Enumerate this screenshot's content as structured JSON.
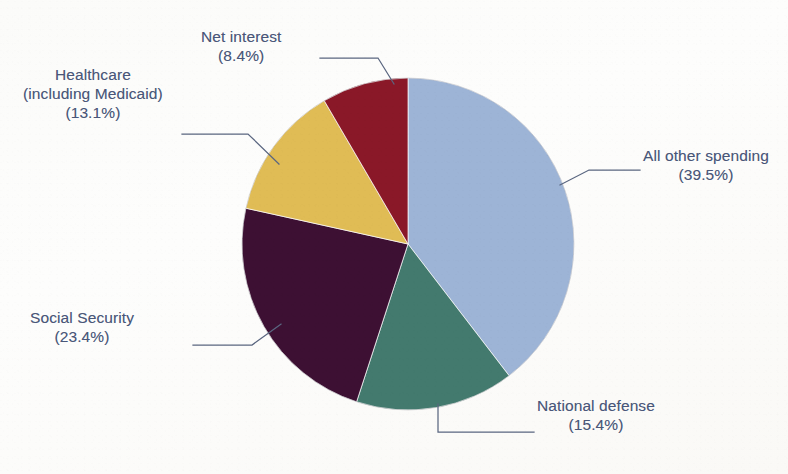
{
  "chart_data": {
    "type": "pie",
    "title": "",
    "subtitle": "",
    "xlabel": "",
    "ylabel": "",
    "legend_position": "none",
    "grid": false,
    "labels_inline": false,
    "start_angle_deg": 0,
    "direction": "clockwise",
    "categories": [
      "All other spending",
      "National defense",
      "Social Security",
      "Healthcare (including Medicaid)",
      "Net interest"
    ],
    "values": [
      39.5,
      15.4,
      23.4,
      13.1,
      8.4
    ],
    "value_unit": "%",
    "colors": [
      "#9db4d6",
      "#437a6e",
      "#3d1033",
      "#e0bc55",
      "#8a1828"
    ],
    "slices": [
      {
        "name": "All other spending",
        "value": 39.5,
        "value_text": "(39.5%)",
        "color": "#9db4d6",
        "start_deg": 0,
        "end_deg": 142.2
      },
      {
        "name": "National defense",
        "value": 15.4,
        "value_text": "(15.4%)",
        "color": "#437a6e",
        "start_deg": 142.2,
        "end_deg": 197.64
      },
      {
        "name": "Social Security",
        "value": 23.4,
        "value_text": "(23.4%)",
        "color": "#3d1033",
        "start_deg": 197.64,
        "end_deg": 281.88
      },
      {
        "name": "Healthcare (including Medicaid)",
        "value": 13.1,
        "value_text": "(13.1%)",
        "color": "#e0bc55",
        "start_deg": 281.88,
        "end_deg": 329.04
      },
      {
        "name": "Net interest",
        "value": 8.4,
        "value_text": "(8.4%)",
        "color": "#8a1828",
        "start_deg": 329.04,
        "end_deg": 360
      }
    ]
  },
  "labels": {
    "net_interest": {
      "line1": "Net interest",
      "line2": "(8.4%)"
    },
    "healthcare": {
      "line1": "Healthcare",
      "line2": "(including Medicaid)",
      "line3": "(13.1%)"
    },
    "all_other_spending": {
      "line1": "All other spending",
      "line2": "(39.5%)"
    },
    "social_security": {
      "line1": "Social Security",
      "line2": "(23.4%)"
    },
    "national_defense": {
      "line1": "National defense",
      "line2": "(15.4%)"
    }
  },
  "style": {
    "text_color": "#4a5779",
    "leader_color": "#5a6680",
    "background": "#fdfdfb"
  }
}
